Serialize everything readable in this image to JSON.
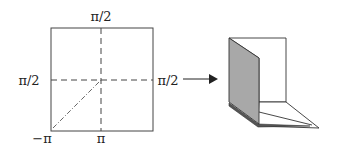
{
  "diagram": {
    "square_labels": {
      "top": "π/2",
      "left": "π/2",
      "right": "π/2",
      "bottom_left": "−π",
      "bottom": "π"
    },
    "colors": {
      "stroke": "#333333",
      "shaded_panel": "#a8a8a8",
      "shaded_edge": "#666666",
      "background": "#ffffff"
    }
  }
}
